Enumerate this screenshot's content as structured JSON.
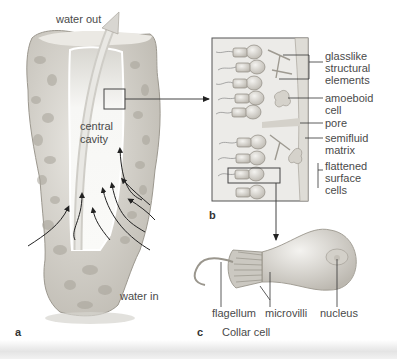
{
  "panel_a": {
    "letter": "a",
    "labels": {
      "water_out": "water out",
      "central_cavity_line1": "central",
      "central_cavity_line2": "cavity",
      "water_in": "water in"
    }
  },
  "panel_b": {
    "letter": "b",
    "labels": {
      "glasslike_1": "glasslike",
      "glasslike_2": "structural",
      "glasslike_3": "elements",
      "amoeboid_1": "amoeboid",
      "amoeboid_2": "cell",
      "pore": "pore",
      "semifluid_1": "semifluid",
      "semifluid_2": "matrix",
      "flattened_1": "flattened",
      "flattened_2": "surface",
      "flattened_3": "cells"
    }
  },
  "panel_c": {
    "letter": "c",
    "title": "Collar cell",
    "labels": {
      "flagellum": "flagellum",
      "microvilli": "microvilli",
      "nucleus": "nucleus"
    }
  },
  "colors": {
    "sponge_body": "#d9d6cf",
    "sponge_shadow": "#a9a59c",
    "cell": "#cfccc6",
    "leader": "#333333",
    "box": "#444444"
  }
}
